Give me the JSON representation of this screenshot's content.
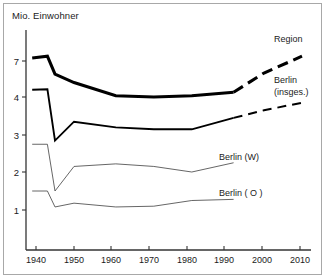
{
  "figure": {
    "outer_border_color": "#a8a8a8",
    "background": "#ffffff"
  },
  "labels": {
    "unit_title": "Mio. Einwohner",
    "region": "Region",
    "berlin_total_line1": "Berlin",
    "berlin_total_line2": "(insges.)",
    "berlin_west": "Berlin (W)",
    "berlin_east": "Berlin ( O )"
  },
  "chart_data": {
    "type": "line",
    "title": "Mio. Einwohner",
    "xlabel": "",
    "ylabel": "Mio. Einwohner",
    "xlim": [
      1936,
      2013
    ],
    "ylim": [
      0,
      7.8
    ],
    "grid": false,
    "legend": "inline-labels",
    "xticks": [
      1940,
      1950,
      1960,
      1970,
      1980,
      1990,
      2000,
      2010
    ],
    "xtick_labels": [
      "1940",
      "1950",
      "1960",
      "1970",
      "1980",
      "1990",
      "2000",
      "2010"
    ],
    "yticks": [
      1,
      2,
      3,
      4,
      7
    ],
    "ytick_labels": [
      "1",
      "2",
      "3",
      "4",
      "7"
    ],
    "y_axis_note": "nonlinear spacing: 1,2,3,4 evenly spaced, then 7",
    "series": [
      {
        "name": "Region",
        "style": "thick-solid",
        "x": [
          1939,
          1943,
          1945,
          1950,
          1961,
          1971,
          1981,
          1992
        ],
        "values": [
          7.25,
          7.4,
          5.9,
          5.2,
          4.1,
          4.0,
          4.1,
          4.4
        ]
      },
      {
        "name": "Region (Prognose)",
        "style": "thick-dashed",
        "x": [
          1992,
          2000,
          2010
        ],
        "values": [
          4.4,
          6.0,
          7.4
        ]
      },
      {
        "name": "Berlin (insges.)",
        "style": "medium-solid",
        "x": [
          1939,
          1943,
          1945,
          1950,
          1961,
          1971,
          1981,
          1992
        ],
        "values": [
          4.6,
          4.65,
          2.85,
          3.35,
          3.2,
          3.15,
          3.15,
          3.45
        ]
      },
      {
        "name": "Berlin (insges.) (Prognose)",
        "style": "medium-dashed",
        "x": [
          1992,
          2000,
          2010
        ],
        "values": [
          3.45,
          3.65,
          3.85
        ]
      },
      {
        "name": "Berlin (W)",
        "style": "thin-solid",
        "x": [
          1939,
          1943,
          1945,
          1950,
          1961,
          1971,
          1981,
          1992
        ],
        "values": [
          2.75,
          2.75,
          1.5,
          2.15,
          2.22,
          2.15,
          2.0,
          2.25
        ]
      },
      {
        "name": "Berlin ( O )",
        "style": "thin-solid",
        "x": [
          1939,
          1943,
          1945,
          1950,
          1961,
          1971,
          1981,
          1992
        ],
        "values": [
          1.5,
          1.5,
          1.08,
          1.18,
          1.08,
          1.1,
          1.25,
          1.28
        ]
      }
    ]
  }
}
